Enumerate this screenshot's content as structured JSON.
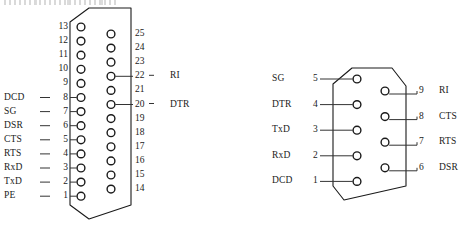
{
  "diagram": {
    "stroke_color": "#1a1a1a",
    "background_color": "#ffffff"
  },
  "db25": {
    "name": "DB25 connector",
    "left_pins": [
      {
        "num": "13",
        "signal": ""
      },
      {
        "num": "12",
        "signal": ""
      },
      {
        "num": "11",
        "signal": ""
      },
      {
        "num": "10",
        "signal": ""
      },
      {
        "num": "9",
        "signal": ""
      },
      {
        "num": "8",
        "signal": "DCD"
      },
      {
        "num": "7",
        "signal": "SG"
      },
      {
        "num": "6",
        "signal": "DSR"
      },
      {
        "num": "5",
        "signal": "CTS"
      },
      {
        "num": "4",
        "signal": "RTS"
      },
      {
        "num": "3",
        "signal": "RxD"
      },
      {
        "num": "2",
        "signal": "TxD"
      },
      {
        "num": "1",
        "signal": "PE"
      }
    ],
    "right_pins": [
      {
        "num": "25",
        "signal": ""
      },
      {
        "num": "24",
        "signal": ""
      },
      {
        "num": "23",
        "signal": ""
      },
      {
        "num": "22",
        "signal": "RI"
      },
      {
        "num": "21",
        "signal": ""
      },
      {
        "num": "20",
        "signal": "DTR"
      },
      {
        "num": "19",
        "signal": ""
      },
      {
        "num": "18",
        "signal": ""
      },
      {
        "num": "17",
        "signal": ""
      },
      {
        "num": "16",
        "signal": ""
      },
      {
        "num": "15",
        "signal": ""
      },
      {
        "num": "14",
        "signal": ""
      }
    ]
  },
  "db9": {
    "name": "DB9 connector",
    "left_pins": [
      {
        "num": "5",
        "signal": "SG"
      },
      {
        "num": "4",
        "signal": "DTR"
      },
      {
        "num": "3",
        "signal": "TxD"
      },
      {
        "num": "2",
        "signal": "RxD"
      },
      {
        "num": "1",
        "signal": "DCD"
      }
    ],
    "right_pins": [
      {
        "num": "9",
        "signal": "RI"
      },
      {
        "num": "8",
        "signal": "CTS"
      },
      {
        "num": "7",
        "signal": "RTS"
      },
      {
        "num": "6",
        "signal": "DSR"
      }
    ]
  }
}
